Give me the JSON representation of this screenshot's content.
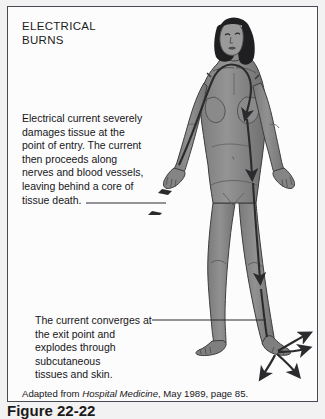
{
  "figure": {
    "title": "ELECTRICAL\nBURNS",
    "background_color": "#fcfcfc",
    "border_color": "#4a4a52",
    "page_color": "#f2f2f2"
  },
  "callouts": [
    {
      "id": "entry",
      "text": "Electrical current severely\ndamages tissue at the\npoint of entry.  The current\nthen proceeds along\nnerves and  blood vessels,\nleaving behind a core of\ntissue death.",
      "leader": "horizontal-line-to-lightning-bolt"
    },
    {
      "id": "exit",
      "text": "The current converges at\nthe exit point and\nexplodes through\nsubcutaneous\ntissues and skin.",
      "leader": "horizontal-line-to-foot"
    }
  ],
  "attribution": {
    "prefix": "Adapted from ",
    "source": "Hospital Medicine",
    "suffix": ", May 1989, page 85."
  },
  "caption": {
    "text": "Figure 22-22"
  },
  "illustration": {
    "subject": "standing-female-figure",
    "skin_color": "#8c8c8c",
    "skin_shadow_color": "#6f6f6f",
    "outline_color": "#3a3a3a",
    "hair_color": "#1f1f22",
    "arrow_color": "#2b2b2e",
    "entry_point": "right-hand",
    "exit_point": "right-foot",
    "current_path": "shoulder-arch-down-torso-down-leg-to-foot",
    "entry_marker": "lightning-bolt",
    "exit_marker": "four-diverging-arrows"
  }
}
